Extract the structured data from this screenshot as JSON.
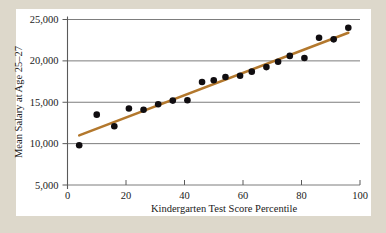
{
  "figure": {
    "background_color": "#ddd8cb",
    "card_color": "#ffffff",
    "point_color": "#100d10",
    "line_color": "#b3782d",
    "grid_color": "#6e6e6e"
  },
  "chart_data": {
    "type": "scatter",
    "title": "",
    "subtitle": "",
    "xlabel": "Kindergarten Test Score Percentile",
    "ylabel": "Mean Salary at Age 25–27",
    "xlim": [
      0,
      100
    ],
    "ylim": [
      5000,
      25000
    ],
    "xticks": [
      0,
      20,
      40,
      60,
      80,
      100
    ],
    "xticklabels": [
      "0",
      "20",
      "40",
      "60",
      "80",
      "100"
    ],
    "yticks": [
      5000,
      10000,
      15000,
      20000,
      25000
    ],
    "yticklabels": [
      "5,000",
      "10,000",
      "15,000",
      "20,000",
      "25,000"
    ],
    "grid": "horizontal",
    "legend": "none",
    "series": [
      {
        "name": "Mean salary by kindergarten test score percentile",
        "type": "scatter",
        "marker": "circle",
        "color": "#100d10",
        "points": [
          {
            "x": 4,
            "y": 9800
          },
          {
            "x": 10,
            "y": 13500
          },
          {
            "x": 16,
            "y": 12100
          },
          {
            "x": 21,
            "y": 14250
          },
          {
            "x": 26,
            "y": 14100
          },
          {
            "x": 31,
            "y": 14750
          },
          {
            "x": 36,
            "y": 15200
          },
          {
            "x": 41,
            "y": 15250
          },
          {
            "x": 46,
            "y": 17450
          },
          {
            "x": 50,
            "y": 17650
          },
          {
            "x": 54,
            "y": 18050
          },
          {
            "x": 59,
            "y": 18200
          },
          {
            "x": 63,
            "y": 18700
          },
          {
            "x": 68,
            "y": 19250
          },
          {
            "x": 72,
            "y": 19900
          },
          {
            "x": 76,
            "y": 20600
          },
          {
            "x": 81,
            "y": 20350
          },
          {
            "x": 86,
            "y": 22800
          },
          {
            "x": 91,
            "y": 22600
          },
          {
            "x": 96,
            "y": 24000
          }
        ]
      },
      {
        "name": "Fitted regression line",
        "type": "line",
        "color": "#b3782d",
        "endpoints": [
          {
            "x": 4,
            "y": 11000
          },
          {
            "x": 96,
            "y": 23400
          }
        ]
      }
    ]
  }
}
